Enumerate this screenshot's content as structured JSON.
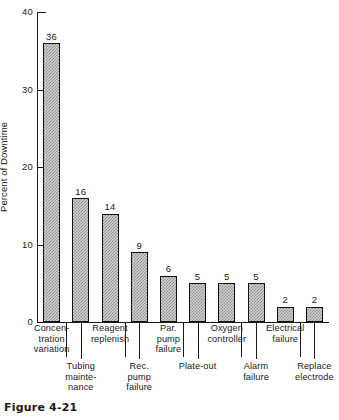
{
  "caption": "Figure 4-21",
  "chart_data": {
    "type": "bar",
    "title": "",
    "subtitle": "",
    "xlabel": "",
    "ylabel": "Percent of Downtime",
    "ylim": [
      0,
      40
    ],
    "yticks": [
      0,
      10,
      20,
      30,
      40
    ],
    "ytick_labels": [
      "0",
      "10",
      "20",
      "30",
      "40"
    ],
    "grid": false,
    "legend": "none",
    "annotations": "Value labels printed above each bar",
    "categories": [
      "Concen-\ntration\nvariation",
      "Tubing\nmainte-\nnance",
      "Reagent\nreplenish",
      "Rec.\npump\nfailure",
      "Par.\npump\nfailure",
      "Plate-out",
      "Oxygen\ncontroller",
      "Alarm\nfailure",
      "Electrical\nfailure",
      "Replace\nelectrode"
    ],
    "category_names": [
      "Concentration variation",
      "Tubing maintenance",
      "Reagent replenish",
      "Rec. pump failure",
      "Par. pump failure",
      "Plate-out",
      "Oxygen controller",
      "Alarm failure",
      "Electrical failure",
      "Replace electrode"
    ],
    "values": [
      36,
      16,
      14,
      9,
      6,
      5,
      5,
      5,
      2,
      2
    ],
    "value_labels": [
      "36",
      "16",
      "14",
      "9",
      "6",
      "5",
      "5",
      "5",
      "2",
      "2"
    ],
    "colors": {
      "bar_fill": "#d2d2d2",
      "bar_hatch": "#8e8e8e",
      "bar_edge": "#111111",
      "axis": "#1a1a1a",
      "background": "#ffffff"
    }
  }
}
